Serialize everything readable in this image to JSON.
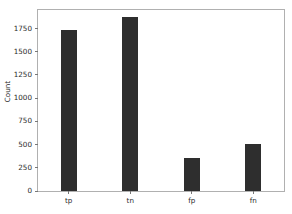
{
  "chart_data": {
    "type": "bar",
    "title": "",
    "xlabel": "",
    "ylabel": "Count",
    "categories": [
      "tp",
      "tn",
      "fp",
      "fn"
    ],
    "values": [
      1730,
      1880,
      360,
      510
    ],
    "ylim": [
      0,
      1950
    ],
    "yticks": [
      0,
      250,
      500,
      750,
      1000,
      1250,
      1500,
      1750
    ],
    "ytick_labels": [
      "0",
      "250",
      "500",
      "750",
      "1000",
      "1250",
      "1500",
      "1750"
    ],
    "grid": false,
    "legend": null,
    "bar_color": "#2e2e2e",
    "background_color": "#ffffff",
    "spine_color": "#b0b0b0",
    "tick_color": "#777777",
    "text_color": "#2b2b2b"
  }
}
